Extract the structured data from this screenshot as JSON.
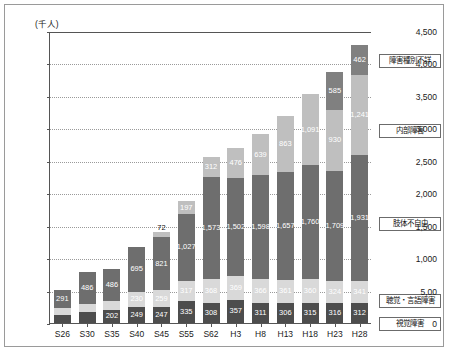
{
  "chart_data": {
    "type": "bar",
    "stacked": true,
    "title": "",
    "xlabel": "",
    "ylabel": "(千人)",
    "ylim": [
      0,
      4500
    ],
    "yticks": [
      0,
      500,
      1000,
      1500,
      2000,
      2500,
      3000,
      3500,
      4000,
      4500
    ],
    "ytick_labels": [
      "0",
      "5,00",
      "1,000",
      "1,500",
      "2,000",
      "2,500",
      "3,000",
      "3,500",
      "4,000",
      "4,500"
    ],
    "grid": true,
    "legend_position": "right",
    "categories": [
      "S26",
      "S30",
      "S35",
      "S40",
      "S45",
      "S55",
      "S62",
      "H3",
      "H8",
      "H13",
      "H18",
      "H23",
      "H28"
    ],
    "series": [
      {
        "name": "視覚障害",
        "color": "#4d4d4d",
        "values": [
          124,
          168,
          202,
          249,
          247,
          335,
          308,
          357,
          311,
          306,
          315,
          316,
          312
        ],
        "labels": [
          "124",
          "168",
          "202",
          "249",
          "247",
          "335",
          "308",
          "357",
          "311",
          "306",
          "315",
          "316",
          "312"
        ]
      },
      {
        "name": "聴覚・言語障害",
        "color": "#d9d9d9",
        "values": [
          100,
          130,
          141,
          230,
          259,
          317,
          368,
          369,
          366,
          361,
          360,
          324,
          341
        ],
        "labels": [
          "100",
          "130",
          "141",
          "230",
          "259",
          "317",
          "368",
          "369",
          "366",
          "361",
          "360",
          "324",
          "341"
        ]
      },
      {
        "name": "肢体不自由",
        "color": "#6e6e6e",
        "values": [
          291,
          486,
          486,
          695,
          821,
          1027,
          1573,
          1502,
          1598,
          1657,
          1760,
          1709,
          1931
        ],
        "labels": [
          "291",
          "486",
          "486",
          "695",
          "821",
          "1,027",
          "1,573",
          "1,502",
          "1,598",
          "1,657",
          "1,760",
          "1,709",
          "1,931"
        ]
      },
      {
        "name": "内部障害",
        "color": "#bfbfbf",
        "values": [
          0,
          0,
          0,
          0,
          72,
          197,
          312,
          476,
          639,
          863,
          1091,
          930,
          1241
        ],
        "labels": [
          "",
          "",
          "",
          "",
          "72",
          "197",
          "312",
          "476",
          "639",
          "863",
          "1,091",
          "930",
          "1,241"
        ]
      },
      {
        "name": "障害種別不詳",
        "color": "#808080",
        "values": [
          0,
          0,
          0,
          0,
          0,
          0,
          0,
          0,
          0,
          0,
          0,
          585,
          462
        ],
        "labels": [
          "",
          "",
          "",
          "",
          "",
          "",
          "",
          "",
          "",
          "",
          "",
          "585",
          "462"
        ]
      }
    ]
  },
  "legend": {
    "items": [
      {
        "label": "障害種別不詳"
      },
      {
        "label": "内部障害"
      },
      {
        "label": "肢体不自由"
      },
      {
        "label": "聴覚・言語障害"
      },
      {
        "label": "視覚障害"
      }
    ]
  }
}
